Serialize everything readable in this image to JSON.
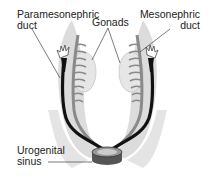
{
  "diagram": {
    "labels": {
      "paramesonephric_line1": "Paramesonephric",
      "paramesonephric_line2": "duct",
      "mesonephric_line1": "Mesonephric",
      "mesonephric_line2": "duct",
      "gonads": "Gonads",
      "urogenital_line1": "Urogenital",
      "urogenital_line2": "sinus"
    },
    "colors": {
      "background": "#ffffff",
      "ridge": "#dcdcdc",
      "gonad": "#e6e6e6",
      "mesonephric_tubules": "#8a8a8a",
      "paramesonephric_duct": "#111111",
      "sinus": "#555555",
      "leader_line": "#444444"
    }
  }
}
